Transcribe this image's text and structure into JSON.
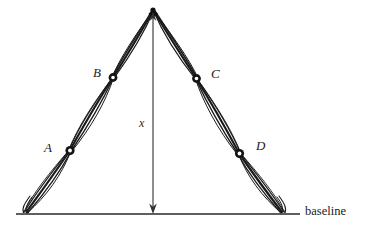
{
  "figure": {
    "kind": "hand-drawn-triangulation-diagram",
    "background_color": "#ffffff",
    "ink_color": "#1b1b1b",
    "thin_ink_color": "#3a3a3a",
    "width": 377,
    "height": 232
  },
  "labels": {
    "vertex_a": "A",
    "vertex_b": "B",
    "vertex_c": "C",
    "vertex_d": "D",
    "height_measure": "x",
    "baseline": "baseline"
  },
  "geometry": {
    "apex": {
      "x": 153,
      "y": 9
    },
    "left_base": {
      "x": 25,
      "y": 213
    },
    "right_base": {
      "x": 283,
      "y": 213
    },
    "baseline_y": 214,
    "baseline_x_start": 16,
    "baseline_x_end": 300,
    "nodes": [
      {
        "name": "A",
        "x": 70,
        "y": 150,
        "label_x": 44,
        "label_y": 141
      },
      {
        "name": "B",
        "x": 113,
        "y": 77,
        "label_x": 93,
        "label_y": 66
      },
      {
        "name": "C",
        "x": 196,
        "y": 78,
        "label_x": 211,
        "label_y": 67
      },
      {
        "name": "D",
        "x": 239,
        "y": 153,
        "label_x": 256,
        "label_y": 139
      }
    ],
    "height_arrow": {
      "x": 153,
      "y_top": 14,
      "y_bottom": 213,
      "label_x": 139,
      "label_y": 117
    },
    "baseline_label_pos": {
      "x": 305,
      "y": 205
    }
  },
  "strands": {
    "count_per_limb": 4,
    "description": "bundles of thin curved strands bowing apart between nodes"
  }
}
